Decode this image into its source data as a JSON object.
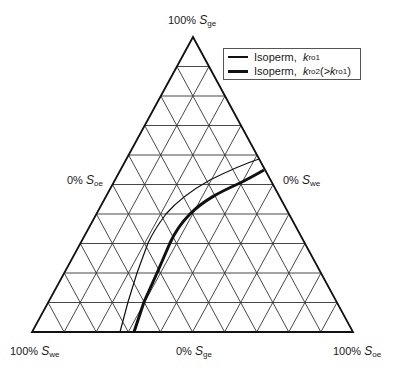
{
  "diagram": {
    "type": "ternary",
    "subdivisions": 10,
    "vertices": {
      "top": {
        "label_pct": "100%",
        "label_var": "S",
        "label_sub": "ge"
      },
      "bottom_left": {
        "label_pct": "100%",
        "label_var": "S",
        "label_sub": "we"
      },
      "bottom_right": {
        "label_pct": "100%",
        "label_var": "S",
        "label_sub": "oe"
      }
    },
    "edges": {
      "left": {
        "label_pct": "0%",
        "label_var": "S",
        "label_sub": "oe"
      },
      "right": {
        "label_pct": "0%",
        "label_var": "S",
        "label_sub": "we"
      },
      "bottom": {
        "label_pct": "0%",
        "label_var": "S",
        "label_sub": "ge"
      }
    },
    "legend": [
      {
        "text": "Isoperm,",
        "var": "k",
        "sub": "ro1",
        "suffix_open": "",
        "suffix_var": "",
        "suffix_sub": "",
        "suffix_close": "",
        "style": "thin"
      },
      {
        "text": "Isoperm,",
        "var": "k",
        "sub": "ro2",
        "suffix_open": " (>",
        "suffix_var": "k",
        "suffix_sub": "ro1",
        "suffix_close": ")",
        "style": "thick"
      }
    ],
    "curves": [
      {
        "name": "Isoperm kro1",
        "stroke_width": 1.2,
        "color": "#111111"
      },
      {
        "name": "Isoperm kro2",
        "stroke_width": 3,
        "color": "#111111"
      }
    ],
    "colors": {
      "line": "#111111",
      "grid": "#333333",
      "background": "#ffffff"
    }
  }
}
